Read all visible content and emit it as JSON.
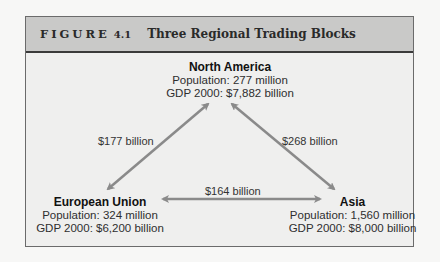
{
  "figure": {
    "label": "FIGURE",
    "number": "4.1",
    "title": "Three Regional Trading Blocks"
  },
  "nodes": {
    "north_america": {
      "name": "North America",
      "population": "Population: 277 million",
      "gdp": "GDP 2000: $7,882 billion"
    },
    "european_union": {
      "name": "European Union",
      "population": "Population: 324 million",
      "gdp": "GDP 2000: $6,200 billion"
    },
    "asia": {
      "name": "Asia",
      "population": "Population: 1,560 million",
      "gdp": "GDP 2000: $8,000 billion"
    }
  },
  "edges": {
    "na_eu": "$177 billion",
    "na_asia": "$268 billion",
    "eu_asia": "$164 billion"
  },
  "colors": {
    "arrow": "#8a8a8a",
    "header_bg": "#c9c9c8",
    "panel_bg": "#efefee"
  }
}
